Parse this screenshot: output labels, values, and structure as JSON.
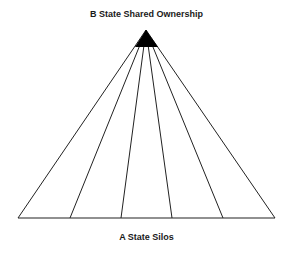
{
  "diagram": {
    "top_label": "B State Shared Ownership",
    "bottom_label": "A State Silos",
    "apex": {
      "x": 146,
      "y": 30
    },
    "base": {
      "y": 218,
      "points_x": [
        18,
        70,
        121,
        172,
        223,
        275
      ]
    },
    "apex_fill": {
      "tip_y": 30,
      "base_y": 47,
      "left_x": 135,
      "right_x": 158
    },
    "colors": {
      "line": "#222222",
      "fill": "#000000",
      "background": "#ffffff"
    }
  }
}
